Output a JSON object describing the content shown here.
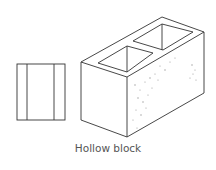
{
  "figure": {
    "caption": "Hollow block",
    "views": [
      "side-elevation",
      "isometric-view"
    ],
    "colors": {
      "line": "#333333",
      "speckle": "#9a9a9a",
      "background": "#ffffff",
      "caption": "#555555"
    }
  }
}
